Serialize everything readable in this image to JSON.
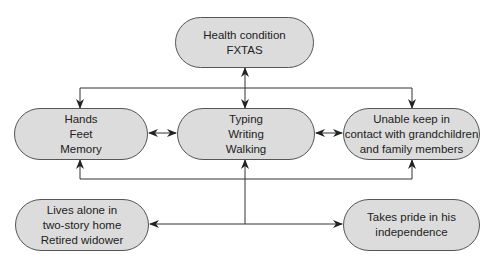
{
  "diagram": {
    "nodes": {
      "health": {
        "lines": [
          "Health condition",
          "FXTAS"
        ]
      },
      "body": {
        "lines": [
          "Hands",
          "Feet",
          "Memory"
        ]
      },
      "activities": {
        "lines": [
          "Typing",
          "Writing",
          "Walking"
        ]
      },
      "participation": {
        "lines": [
          "Unable keep in",
          "contact with grandchildren",
          "and family members"
        ]
      },
      "environment": {
        "lines": [
          "Lives alone in",
          "two-story home",
          "Retired widower"
        ]
      },
      "personal": {
        "lines": [
          "Takes pride in his",
          "independence"
        ]
      }
    },
    "edges": [
      {
        "from": "health",
        "to": "activities",
        "type": "bidirectional"
      },
      {
        "from": "health",
        "to": "body",
        "type": "directed"
      },
      {
        "from": "health",
        "to": "participation",
        "type": "directed"
      },
      {
        "from": "body",
        "to": "activities",
        "type": "bidirectional"
      },
      {
        "from": "activities",
        "to": "participation",
        "type": "bidirectional"
      },
      {
        "from": "context",
        "to": "body",
        "type": "directed"
      },
      {
        "from": "context",
        "to": "activities",
        "type": "directed"
      },
      {
        "from": "context",
        "to": "participation",
        "type": "directed"
      },
      {
        "from": "context",
        "to": "environment",
        "type": "directed"
      },
      {
        "from": "context",
        "to": "personal",
        "type": "directed"
      }
    ],
    "colors": {
      "node_fill": "#dcdcdc",
      "node_border": "#555555",
      "line": "#333333"
    }
  }
}
